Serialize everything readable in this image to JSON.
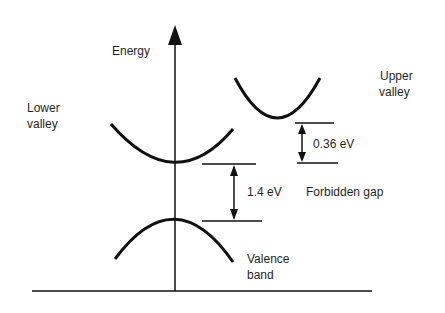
{
  "diagram": {
    "axis_label": "Energy",
    "lower_valley_label": [
      "Lower",
      "valley"
    ],
    "upper_valley_label": [
      "Upper",
      "valley"
    ],
    "valence_band_label": [
      "Valence",
      "band"
    ],
    "gap_value": "1.4 eV",
    "gap_label": "Forbidden gap",
    "valley_separation_value": "0.36 eV",
    "colors": {
      "line": "#111111",
      "text": "#1f1f1f",
      "background": "#ffffff"
    }
  }
}
